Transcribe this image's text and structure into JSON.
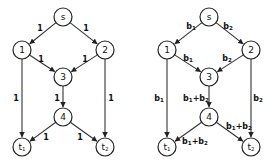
{
  "graphs": [
    {
      "name": "unit-capacity-network",
      "nodes": [
        {
          "id": "s",
          "label": "s",
          "sub": "",
          "x": 63,
          "y": 17
        },
        {
          "id": "1",
          "label": "1",
          "sub": "",
          "x": 22,
          "y": 50
        },
        {
          "id": "2",
          "label": "2",
          "sub": "",
          "x": 105,
          "y": 50
        },
        {
          "id": "3",
          "label": "3",
          "sub": "",
          "x": 63,
          "y": 77
        },
        {
          "id": "4",
          "label": "4",
          "sub": "",
          "x": 63,
          "y": 117
        },
        {
          "id": "t1",
          "label": "t",
          "sub": "1",
          "x": 22,
          "y": 147
        },
        {
          "id": "t2",
          "label": "t",
          "sub": "2",
          "x": 105,
          "y": 147
        }
      ],
      "edges": [
        {
          "from": "s",
          "to": "1",
          "label": "1",
          "lx": 40,
          "ly": 28
        },
        {
          "from": "s",
          "to": "2",
          "label": "1",
          "lx": 86,
          "ly": 28
        },
        {
          "from": "1",
          "to": "3",
          "label": "1",
          "lx": 41,
          "ly": 59
        },
        {
          "from": "2",
          "to": "3",
          "label": "1",
          "lx": 85,
          "ly": 59
        },
        {
          "from": "1",
          "to": "t1",
          "label": "1",
          "lx": 16,
          "ly": 98
        },
        {
          "from": "3",
          "to": "4",
          "label": "1",
          "lx": 57,
          "ly": 98
        },
        {
          "from": "2",
          "to": "t2",
          "label": "1",
          "lx": 111,
          "ly": 98
        },
        {
          "from": "4",
          "to": "t1",
          "label": "1",
          "lx": 46,
          "ly": 137
        },
        {
          "from": "4",
          "to": "t2",
          "label": "1",
          "lx": 80,
          "ly": 137
        }
      ]
    },
    {
      "name": "coded-network",
      "nodes": [
        {
          "id": "s",
          "label": "s",
          "sub": "",
          "x": 209,
          "y": 17
        },
        {
          "id": "1",
          "label": "1",
          "sub": "",
          "x": 167,
          "y": 50
        },
        {
          "id": "2",
          "label": "2",
          "sub": "",
          "x": 251,
          "y": 50
        },
        {
          "id": "3",
          "label": "3",
          "sub": "",
          "x": 209,
          "y": 77
        },
        {
          "id": "4",
          "label": "4",
          "sub": "",
          "x": 209,
          "y": 117
        },
        {
          "id": "t1",
          "label": "t",
          "sub": "1",
          "x": 167,
          "y": 147
        },
        {
          "id": "t2",
          "label": "t",
          "sub": "2",
          "x": 251,
          "y": 147
        }
      ],
      "edges": [
        {
          "from": "s",
          "to": "1",
          "label": "b1",
          "lx": 191,
          "ly": 26
        },
        {
          "from": "s",
          "to": "2",
          "label": "b2",
          "lx": 228,
          "ly": 26
        },
        {
          "from": "1",
          "to": "3",
          "label": "b1",
          "lx": 188,
          "ly": 58
        },
        {
          "from": "2",
          "to": "3",
          "label": "b2",
          "lx": 227,
          "ly": 58
        },
        {
          "from": "1",
          "to": "t1",
          "label": "b1",
          "lx": 159,
          "ly": 98
        },
        {
          "from": "3",
          "to": "4",
          "label": "b1+b2",
          "lx": 196,
          "ly": 98
        },
        {
          "from": "2",
          "to": "t2",
          "label": "b2",
          "lx": 258,
          "ly": 98
        },
        {
          "from": "4",
          "to": "t1",
          "label": "b1+b2",
          "lx": 195,
          "ly": 141
        },
        {
          "from": "4",
          "to": "t2",
          "label": "b1+b2",
          "lx": 239,
          "ly": 126
        }
      ]
    }
  ]
}
